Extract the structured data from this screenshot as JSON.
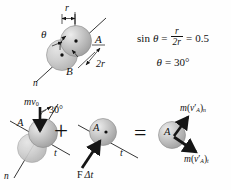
{
  "figure": {
    "background": "#fefefe",
    "ink": "#121212",
    "sphere_fill": "#b9b9b9",
    "sphere_highlight": "#e8e8e8",
    "sphere_edge": "#8a8a8a"
  },
  "geometry_diagram": {
    "label_sphere_a": "A",
    "label_sphere_b": "B",
    "label_r": "r",
    "label_2r": "2r",
    "label_theta": "θ",
    "label_axis_n": "n"
  },
  "equations": {
    "line1": {
      "lhs": "sin",
      "theta": "θ",
      "eq1": "=",
      "numerator": "r",
      "denominator": "2r",
      "eq2": "=",
      "value": "0.5"
    },
    "line2": {
      "theta": "θ",
      "eq": "=",
      "value": "30°"
    }
  },
  "impulse_diagram": {
    "term1": {
      "label_sphere_a": "A",
      "label_momentum": "mv",
      "label_momentum_sub": "0",
      "label_angle": "30°",
      "label_axis_t": "t",
      "label_axis_n": "n"
    },
    "operator_plus": "+",
    "term2": {
      "label_sphere_a": "A",
      "label_impulse_force": "F",
      "label_impulse_delta": "Δt",
      "label_axis_t": "t"
    },
    "operator_equals": "=",
    "term3": {
      "label_sphere_a": "A",
      "label_momentum_n": {
        "m": "m",
        "open": "(",
        "v": "v",
        "prime": "′",
        "sub_a": "A",
        "close": ")",
        "sub_n": "n"
      },
      "label_momentum_t": {
        "m": "m",
        "open": "(",
        "v": "v",
        "prime": "′",
        "sub_a": "A",
        "close": ")",
        "sub_t": "t"
      }
    }
  }
}
